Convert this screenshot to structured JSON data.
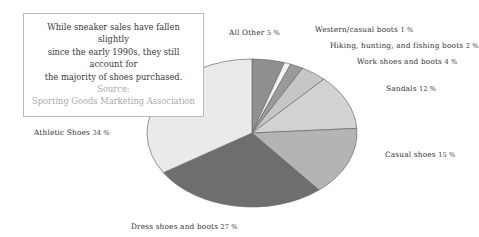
{
  "caption": {
    "line1": "While sneaker sales have fallen slightly",
    "line2": "since the early 1990s, they still account for",
    "line3": "the majority of shoes purchased.",
    "source_label": "Source:",
    "source_name": "Sporting Goods Marketing Association"
  },
  "labels": {
    "all_other": {
      "name": "All Other",
      "pct": "5 %"
    },
    "western": {
      "name": "Western/casual boots",
      "pct": "1 %"
    },
    "hiking": {
      "name": "Hiking, hunting, and fishing boots",
      "pct": "2 %"
    },
    "work": {
      "name": "Work shoes and boots",
      "pct": "4 %"
    },
    "sandals": {
      "name": "Sandals",
      "pct": "12 %"
    },
    "casual": {
      "name": "Casual shoes",
      "pct": "15 %"
    },
    "dress": {
      "name": "Dress shoes and boots",
      "pct": "27 %"
    },
    "athletic": {
      "name": "Athletic Shoes",
      "pct": "34 %"
    }
  },
  "chart_data": {
    "type": "pie",
    "title": "",
    "xlabel": "",
    "ylabel": "",
    "legend_position": "none",
    "grid": false,
    "start_angle_deg": 0,
    "direction": "clockwise",
    "units": "percent",
    "total": 100,
    "categories": [
      "All Other",
      "Western/casual boots",
      "Hiking, hunting, and fishing boots",
      "Work shoes and boots",
      "Sandals",
      "Casual shoes",
      "Dress shoes and boots",
      "Athletic Shoes"
    ],
    "values": [
      5,
      1,
      2,
      4,
      12,
      15,
      27,
      34
    ],
    "slice_colors": [
      "#8f8f8f",
      "#f2f2f2",
      "#9a9a9a",
      "#c6c6c6",
      "#d2d2d2",
      "#b4b4b4",
      "#6e6e6e",
      "#eaeaea"
    ],
    "slice_edge_color": "#6b6b6b",
    "annotation": "While sneaker sales have fallen slightly since the early 1990s, they still account for the majority of shoes purchased. Source: Sporting Goods Marketing Association"
  },
  "geometry": {
    "cx": 252,
    "cy": 133,
    "rx": 105,
    "ry": 74
  }
}
